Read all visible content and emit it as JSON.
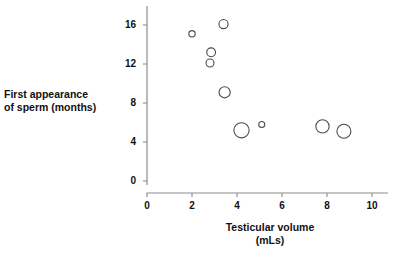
{
  "chart_data": {
    "type": "scatter",
    "title": "",
    "xlabel": "Testicular volume\n(mLs)",
    "ylabel": "First appearance\nof sperm (months)",
    "xlim": [
      0,
      10.8
    ],
    "ylim": [
      0,
      17.2
    ],
    "xticks": [
      0,
      2,
      4,
      6,
      8,
      10
    ],
    "xtick_labels": [
      "0",
      "2",
      "4",
      "6",
      "8",
      "10"
    ],
    "yticks": [
      0,
      4,
      8,
      12,
      16
    ],
    "ytick_labels": [
      "0",
      "4",
      "8",
      "12",
      "16"
    ],
    "grid": false,
    "legend": null,
    "marker_style": "open-circle",
    "points": [
      {
        "x": 2.0,
        "y": 15.1,
        "size": 3.2
      },
      {
        "x": 3.4,
        "y": 16.1,
        "size": 4.6
      },
      {
        "x": 2.85,
        "y": 13.2,
        "size": 4.4
      },
      {
        "x": 2.8,
        "y": 12.1,
        "size": 4.0
      },
      {
        "x": 3.45,
        "y": 9.1,
        "size": 5.6
      },
      {
        "x": 4.2,
        "y": 5.2,
        "size": 7.6
      },
      {
        "x": 5.1,
        "y": 5.8,
        "size": 3.0
      },
      {
        "x": 7.8,
        "y": 5.6,
        "size": 6.6
      },
      {
        "x": 8.75,
        "y": 5.1,
        "size": 7.0
      }
    ]
  },
  "axes": {
    "x_axis_name": "testicular-volume-axis",
    "y_axis_name": "first-appearance-of-sperm-axis"
  },
  "colors": {
    "marker_stroke": "#4a4a4a",
    "axis": "#8c8c8c",
    "text": "#111111",
    "background": "#ffffff"
  }
}
